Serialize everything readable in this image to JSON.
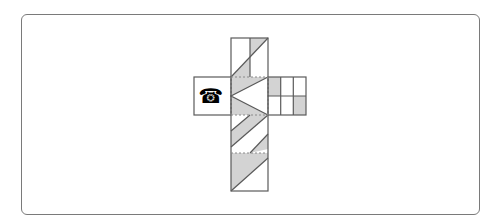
{
  "diagram": {
    "type": "cube-net",
    "colors": {
      "stroke": "#5a5a5a",
      "shade": "#d3d3d3",
      "fold_line": "#8a8a8a",
      "frame": "#7a7a7a"
    },
    "faces": [
      {
        "id": "top",
        "pattern": "vertical midline with diagonal; two grey triangles"
      },
      {
        "id": "center",
        "pattern": "grey with white left-pointing triangle"
      },
      {
        "id": "left",
        "pattern": "telephone symbol"
      },
      {
        "id": "right",
        "pattern": "3x2 grid with two grey cells"
      },
      {
        "id": "lower",
        "pattern": "diagonal grey bands"
      },
      {
        "id": "bottom",
        "pattern": "grey lower-left triangle"
      }
    ],
    "phone_symbol": "☎"
  }
}
